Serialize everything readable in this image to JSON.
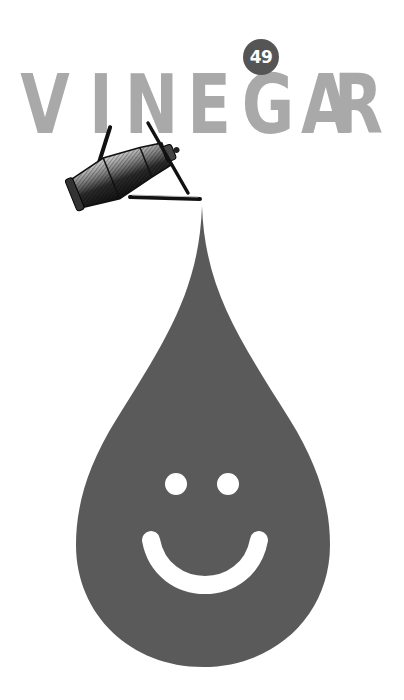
{
  "title": {
    "text": "VINEGAR",
    "letters": [
      "V",
      "I",
      "N",
      "E",
      "G",
      "A",
      "R"
    ],
    "color": "#a9a9a9"
  },
  "badge": {
    "number": "49",
    "background": "#555555",
    "text_color": "#ffffff"
  },
  "illustration": {
    "watering_can": "engraved vintage watering can / cruet pouring",
    "drop": {
      "color": "#5a5a5a",
      "face": "smiley"
    }
  }
}
